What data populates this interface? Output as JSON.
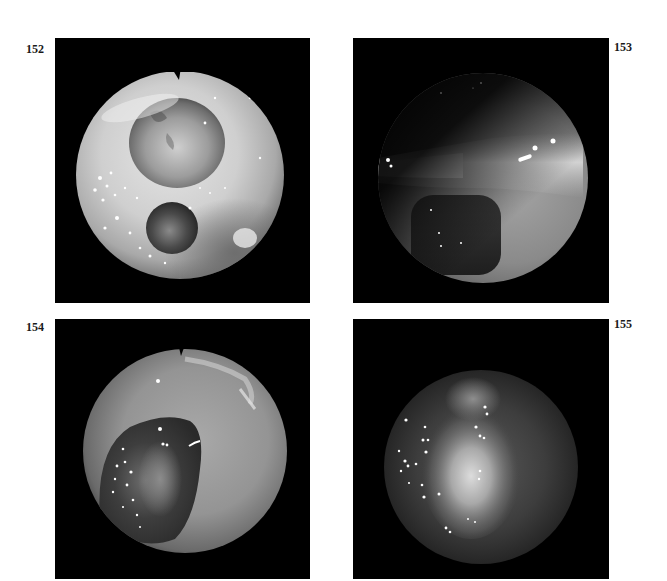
{
  "figures": [
    {
      "number": "152",
      "description": "Endoscopic view: pale domed structure upper center with a smaller dark round cavity below; notch marker at top of scope field",
      "position": "top-left"
    },
    {
      "number": "153",
      "description": "Endoscopic view: bright horizontal band across the field with a dark rounded opening beneath",
      "position": "top-right"
    },
    {
      "number": "154",
      "description": "Endoscopic view: gray mucosal field with a large dark cavity lower left containing specular highlights; notch marker at top",
      "position": "bottom-left"
    },
    {
      "number": "155",
      "description": "Endoscopic view: dark field with a central bright mass and scattered specular highlights",
      "position": "bottom-right"
    }
  ],
  "colors": {
    "page_background": "#ffffff",
    "panel_background": "#000000",
    "label_text": "#1a1a1a"
  }
}
